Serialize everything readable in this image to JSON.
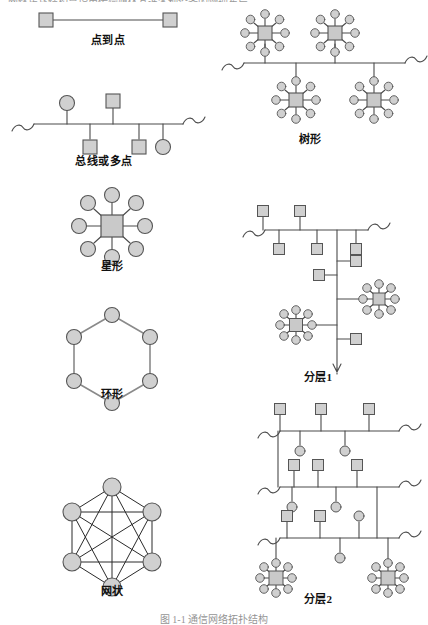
{
  "figure": {
    "top_cut_text": "网络拓扑结构是指用传输媒体互连各种设备的物理布局",
    "caption": "图 1-1  通信网络拓扑结构",
    "node_fill": "#d0d0d0",
    "node_stroke": "#555555",
    "line_color": "#4a4a4a"
  },
  "diagrams": [
    {
      "id": "point-to-point",
      "label": "点到点",
      "type": "point-to-point",
      "label_x": 108,
      "label_y": 38,
      "squares": 2,
      "circles": 0
    },
    {
      "id": "bus-or-multipoint",
      "label": "总线或多点",
      "type": "bus",
      "label_x": 104,
      "label_y": 156,
      "squares": 3,
      "circles": 2
    },
    {
      "id": "star",
      "label": "星形",
      "type": "star",
      "label_x": 112,
      "label_y": 261,
      "squares": 1,
      "circles": 8
    },
    {
      "id": "ring",
      "label": "环形",
      "type": "ring",
      "label_x": 112,
      "label_y": 389,
      "squares": 0,
      "circles": 6
    },
    {
      "id": "mesh",
      "label": "网状",
      "type": "mesh",
      "label_x": 112,
      "label_y": 586,
      "squares": 0,
      "circles": 6,
      "edges": 15
    },
    {
      "id": "tree",
      "label": "树形",
      "type": "tree",
      "label_x": 310,
      "label_y": 134,
      "star_clusters": 4,
      "squares": 4,
      "circles": 32
    },
    {
      "id": "hierarchy-1",
      "label": "分层1",
      "type": "hierarchical",
      "label_x": 318,
      "label_y": 372,
      "star_clusters": 2,
      "squares": 8,
      "circles": 16
    },
    {
      "id": "hierarchy-2",
      "label": "分层2",
      "type": "hierarchical",
      "label_x": 318,
      "label_y": 594,
      "bus_levels": 3,
      "star_clusters": 2,
      "squares": 10,
      "circles": 8
    }
  ]
}
